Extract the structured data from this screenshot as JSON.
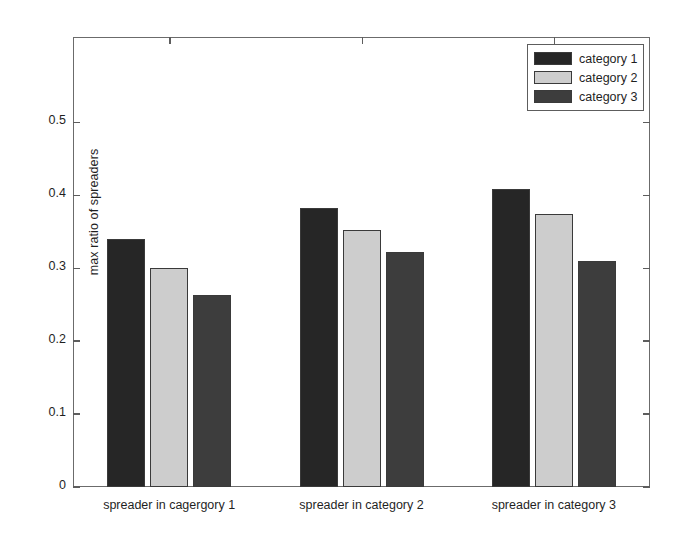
{
  "chart_data": {
    "type": "bar",
    "title": "",
    "xlabel": "",
    "ylabel": "max ratio of spreaders",
    "categories": [
      "spreader in cagergory 1",
      "spreader in category 2",
      "spreader in category 3"
    ],
    "series": [
      {
        "name": "category 1",
        "color": "#262626",
        "values": [
          0.34,
          0.382,
          0.409
        ]
      },
      {
        "name": "category 2",
        "color": "#cdcdcd",
        "values": [
          0.3,
          0.353,
          0.374
        ]
      },
      {
        "name": "category 3",
        "color": "#3d3d3d",
        "values": [
          0.263,
          0.322,
          0.31
        ]
      }
    ],
    "ylim": [
      0,
      0.617
    ],
    "yticks": [
      {
        "value": 0,
        "label": "0"
      },
      {
        "value": 0.1,
        "label": "0.1"
      },
      {
        "value": 0.2,
        "label": "0.2"
      },
      {
        "value": 0.3,
        "label": "0.3"
      },
      {
        "value": 0.4,
        "label": "0.4"
      },
      {
        "value": 0.5,
        "label": "0.5"
      }
    ],
    "grid": false,
    "legend_position": "top-right",
    "legend_entries": [
      "category 1",
      "category 2",
      "category 3"
    ],
    "axis_color": "#6b6b6b",
    "background_color": "#ffffff"
  }
}
